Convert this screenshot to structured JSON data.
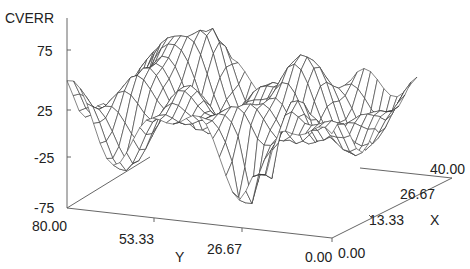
{
  "chart_data": {
    "type": "surface-wireframe",
    "title": "",
    "zlabel": "CVERR",
    "xlabel": "X",
    "ylabel": "Y",
    "z_ticks": [
      "75",
      "25",
      "-25",
      "-75"
    ],
    "zlim": [
      -75,
      75
    ],
    "y_ticks": [
      "80.00",
      "53.33",
      "26.67",
      "0.00"
    ],
    "ylim": [
      80,
      0
    ],
    "x_ticks": [
      "0.00",
      "13.33",
      "26.67",
      "40.00"
    ],
    "xlim": [
      0,
      40
    ],
    "grid": false,
    "legend": null,
    "colors": {
      "line": "#333333",
      "axis": "#555555",
      "background": "#ffffff"
    }
  }
}
